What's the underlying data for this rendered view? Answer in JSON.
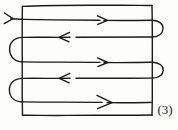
{
  "figure": {
    "kind": "hand-drawn-diagram",
    "label": "(3)",
    "ink_color": "#1a1a1a",
    "background_color": "#fdfdfb",
    "stroke_width": 1.4,
    "canvas": {
      "width": 178,
      "height": 130
    },
    "boundary": {
      "name": "rectangle",
      "left": 22,
      "top": 5,
      "right": 152,
      "bottom": 115
    },
    "entry_arrow": {
      "name": "entry-arrow",
      "direction": "right",
      "x": 8,
      "y": 18
    },
    "passes": [
      {
        "index": 1,
        "y": 20,
        "direction": "right",
        "arrow_x": 104,
        "x_start": 22,
        "x_end": 152,
        "arrow_size": 7
      },
      {
        "index": 2,
        "y": 37,
        "direction": "left",
        "arrow_x": 62,
        "x_start": 162,
        "x_end": 22,
        "arrow_size": 7
      },
      {
        "index": 3,
        "y": 62,
        "direction": "right",
        "arrow_x": 104,
        "x_start": 12,
        "x_end": 152,
        "arrow_size": 7
      },
      {
        "index": 4,
        "y": 78,
        "direction": "left",
        "arrow_x": 62,
        "x_start": 162,
        "x_end": 22,
        "arrow_size": 7
      },
      {
        "index": 5,
        "y": 102,
        "direction": "right",
        "arrow_x": 108,
        "x_start": 12,
        "x_end": 152,
        "arrow_size": 10
      }
    ],
    "turns": [
      {
        "index": 1,
        "side": "right",
        "from_y": 20,
        "to_y": 37,
        "extent": 162
      },
      {
        "index": 2,
        "side": "left",
        "from_y": 37,
        "to_y": 62,
        "extent": 10
      },
      {
        "index": 3,
        "side": "right",
        "from_y": 62,
        "to_y": 78,
        "extent": 162
      },
      {
        "index": 4,
        "side": "left",
        "from_y": 78,
        "to_y": 102,
        "extent": 10
      }
    ],
    "counts": {
      "horizontal_passes": 5,
      "u_turns": 4,
      "right_turns": 2,
      "left_turns": 2
    }
  }
}
